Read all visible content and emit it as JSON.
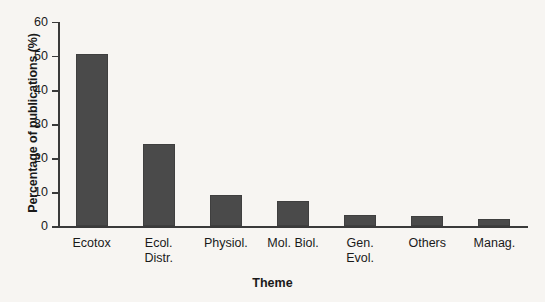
{
  "chart_data": {
    "type": "bar",
    "title": "",
    "xlabel": "Theme",
    "ylabel": "Percentage of publications (%)",
    "categories": [
      "Ecotox",
      "Ecol. Distr.",
      "Physiol.",
      "Mol. Biol.",
      "Gen. Evol.",
      "Others",
      "Manag."
    ],
    "category_lines": [
      [
        "Ecotox"
      ],
      [
        "Ecol.",
        "Distr."
      ],
      [
        "Physiol."
      ],
      [
        "Mol. Biol."
      ],
      [
        "Gen.",
        "Evol."
      ],
      [
        "Others"
      ],
      [
        "Manag."
      ]
    ],
    "values": [
      50.7,
      24.3,
      9.3,
      7.5,
      3.4,
      3.0,
      2.3
    ],
    "ylim": [
      0,
      60
    ],
    "yticks": [
      0,
      10,
      20,
      30,
      40,
      50,
      60
    ],
    "ytick_labels": [
      "0",
      "10",
      "20",
      "30",
      "40",
      "50",
      "60"
    ],
    "grid": false,
    "legend": null,
    "bar_color": "#4a4a4a",
    "axis_color": "#3a3a3a",
    "background_color": "#f7f5f2"
  }
}
